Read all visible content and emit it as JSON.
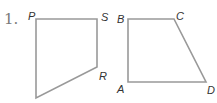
{
  "problem_number": "1.",
  "colors": {
    "stroke": "#999999",
    "label": "#333333",
    "number": "#7a7a7a"
  },
  "figures": [
    {
      "name": "quadrilateral-PSR",
      "vertices": [
        {
          "label": "P",
          "x": 36,
          "y": 19
        },
        {
          "label": "S",
          "x": 97,
          "y": 19
        },
        {
          "label": "R",
          "x": 97,
          "y": 67
        },
        {
          "label": "",
          "x": 36,
          "y": 98
        }
      ]
    },
    {
      "name": "quadrilateral-ABCD",
      "vertices": [
        {
          "label": "B",
          "x": 128,
          "y": 19
        },
        {
          "label": "C",
          "x": 174,
          "y": 19
        },
        {
          "label": "D",
          "x": 206,
          "y": 82
        },
        {
          "label": "A",
          "x": 128,
          "y": 82
        }
      ]
    }
  ],
  "labels": {
    "P": "P",
    "S": "S",
    "R": "R",
    "A": "A",
    "B": "B",
    "C": "C",
    "D": "D"
  }
}
